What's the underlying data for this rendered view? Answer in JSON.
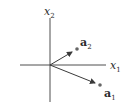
{
  "diagram": {
    "type": "vector-plane",
    "axes": {
      "horizontal": {
        "label": "x",
        "subscript": "1"
      },
      "vertical": {
        "label": "x",
        "subscript": "2"
      }
    },
    "vectors": [
      {
        "label": "a",
        "subscript": "2",
        "direction": "up-right"
      },
      {
        "label": "a",
        "subscript": "1",
        "direction": "down-right"
      }
    ],
    "colors": {
      "axis": "#3a3a3a",
      "vector": "#3a3a3a",
      "point": "#666666"
    }
  }
}
